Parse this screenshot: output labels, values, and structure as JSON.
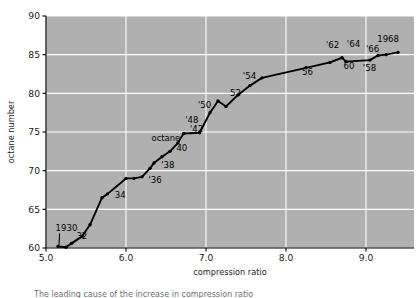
{
  "chart_data": {
    "type": "line",
    "title": "",
    "subtitle": "",
    "xlabel": "compression ratio",
    "ylabel": "octane number",
    "xlim": [
      5.0,
      9.6
    ],
    "ylim": [
      60,
      90
    ],
    "xticks": [
      "5.0",
      "6.0",
      "7.0",
      "8.0",
      "9.0"
    ],
    "xtick_values": [
      5.0,
      6.0,
      7.0,
      8.0,
      9.0
    ],
    "yticks": [
      "60",
      "65",
      "70",
      "75",
      "80",
      "85",
      "90"
    ],
    "ytick_values": [
      60,
      65,
      70,
      75,
      80,
      85,
      90
    ],
    "grid": true,
    "grid_color": "#ffffff",
    "plot_background": "#b0b0b0",
    "line_color": "#000000",
    "marker": "dot",
    "legend": "none",
    "x": [
      5.15,
      5.25,
      5.32,
      5.45,
      5.55,
      5.7,
      5.77,
      6.0,
      6.1,
      6.2,
      6.3,
      6.35,
      6.45,
      6.55,
      6.65,
      6.72,
      6.92,
      7.05,
      7.15,
      7.25,
      7.4,
      7.55,
      7.7,
      8.25,
      8.55,
      8.7,
      8.75,
      9.05,
      9.15,
      9.25,
      9.4
    ],
    "y": [
      60.2,
      60.1,
      60.6,
      61.5,
      63.0,
      66.5,
      67.0,
      69.0,
      69.0,
      69.2,
      70.3,
      71.0,
      71.8,
      72.5,
      73.6,
      74.8,
      74.9,
      77.5,
      79.0,
      78.3,
      79.8,
      81.0,
      82.0,
      83.3,
      84.0,
      84.6,
      84.1,
      84.3,
      84.9,
      85.0,
      85.3
    ],
    "annotations": [
      {
        "text": "1930",
        "x": 5.15,
        "y": 60.2,
        "label_x": 5.12,
        "label_y": 62.2,
        "leader": true
      },
      {
        "text": "32",
        "x": 5.32,
        "y": 60.6,
        "label_x": 5.38,
        "label_y": 61.1,
        "leader": false
      },
      {
        "text": "34",
        "x": 5.77,
        "y": 67.0,
        "label_x": 5.86,
        "label_y": 66.5,
        "leader": false
      },
      {
        "text": "'36",
        "x": 6.2,
        "y": 69.2,
        "label_x": 6.28,
        "label_y": 68.4,
        "leader": false
      },
      {
        "text": "'38",
        "x": 6.35,
        "y": 71.0,
        "label_x": 6.44,
        "label_y": 70.4,
        "leader": false
      },
      {
        "text": "40",
        "x": 6.55,
        "y": 72.5,
        "label_x": 6.63,
        "label_y": 72.5,
        "leader": false
      },
      {
        "text": "'42",
        "x": 6.72,
        "y": 74.8,
        "label_x": 6.8,
        "label_y": 75.0,
        "leader": false
      },
      {
        "text": "'48",
        "x": 6.92,
        "y": 74.9,
        "label_x": 6.74,
        "label_y": 76.1,
        "leader": false
      },
      {
        "text": "'50",
        "x": 7.05,
        "y": 77.5,
        "label_x": 6.9,
        "label_y": 78.1,
        "leader": false
      },
      {
        "text": "52",
        "x": 7.25,
        "y": 78.3,
        "label_x": 7.3,
        "label_y": 79.7,
        "leader": false
      },
      {
        "text": "'54",
        "x": 7.55,
        "y": 81.0,
        "label_x": 7.46,
        "label_y": 81.9,
        "leader": false
      },
      {
        "text": "56",
        "x": 8.25,
        "y": 83.3,
        "label_x": 8.2,
        "label_y": 82.4,
        "leader": false
      },
      {
        "text": "'58",
        "x": 9.05,
        "y": 84.1,
        "label_x": 8.96,
        "label_y": 82.9,
        "leader": false
      },
      {
        "text": "60",
        "x": 8.7,
        "y": 84.6,
        "label_x": 8.72,
        "label_y": 83.2,
        "leader": false
      },
      {
        "text": "'62",
        "x": 8.55,
        "y": 84.0,
        "label_x": 8.5,
        "label_y": 85.9,
        "leader": false
      },
      {
        "text": "'64",
        "x": 8.75,
        "y": 85.1,
        "label_x": 8.76,
        "label_y": 86.0,
        "leader": false
      },
      {
        "text": "'66",
        "x": 9.15,
        "y": 84.9,
        "label_x": 9.0,
        "label_y": 85.3,
        "leader": false
      },
      {
        "text": "1968",
        "x": 9.4,
        "y": 85.3,
        "label_x": 9.14,
        "label_y": 86.6,
        "leader": false
      },
      {
        "text": "octane",
        "x": null,
        "y": null,
        "label_x": 6.32,
        "label_y": 73.9,
        "leader": false
      }
    ]
  },
  "caption": {
    "text": "The leading cause of the increase in compression ratio"
  }
}
